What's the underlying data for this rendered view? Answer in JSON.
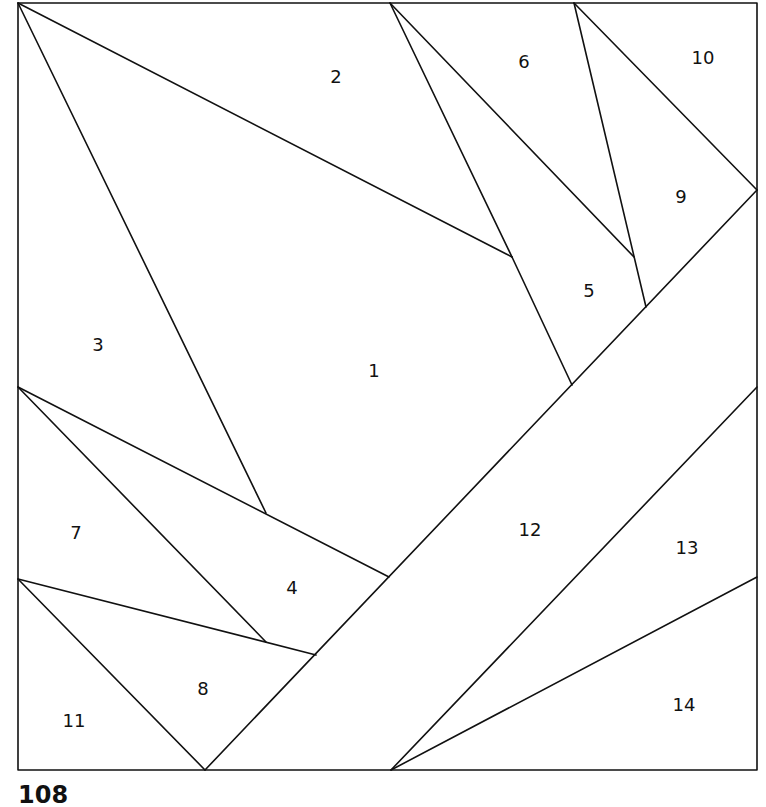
{
  "diagram": {
    "type": "foundation paper piecing pattern",
    "stroke_color": "#111111",
    "background": "#ffffff",
    "pieces": [
      {
        "id": "1",
        "label": "1",
        "x": 374,
        "y": 372
      },
      {
        "id": "2",
        "label": "2",
        "x": 336,
        "y": 78
      },
      {
        "id": "3",
        "label": "3",
        "x": 98,
        "y": 346
      },
      {
        "id": "4",
        "label": "4",
        "x": 292,
        "y": 589
      },
      {
        "id": "5",
        "label": "5",
        "x": 589,
        "y": 292
      },
      {
        "id": "6",
        "label": "6",
        "x": 524,
        "y": 63
      },
      {
        "id": "7",
        "label": "7",
        "x": 76,
        "y": 534
      },
      {
        "id": "8",
        "label": "8",
        "x": 203,
        "y": 690
      },
      {
        "id": "9",
        "label": "9",
        "x": 681,
        "y": 198
      },
      {
        "id": "10",
        "label": "10",
        "x": 703,
        "y": 59
      },
      {
        "id": "11",
        "label": "11",
        "x": 74,
        "y": 722
      },
      {
        "id": "12",
        "label": "12",
        "x": 530,
        "y": 531
      },
      {
        "id": "13",
        "label": "13",
        "x": 687,
        "y": 549
      },
      {
        "id": "14",
        "label": "14",
        "x": 684,
        "y": 706
      }
    ],
    "caption_fragment": "108"
  }
}
